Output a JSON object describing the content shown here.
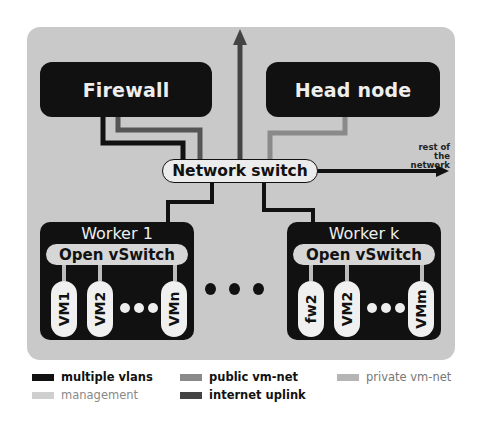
{
  "diagram": {
    "title": "",
    "nodes": {
      "firewall": "Firewall",
      "head_node": "Head node",
      "network_switch": "Network switch",
      "rest_of_network_line1": "rest of the",
      "rest_of_network_line2": "network"
    },
    "workers": [
      {
        "label": "Worker 1",
        "switch": "Open vSwitch",
        "vms": [
          "VM1",
          "VM2",
          "VMn"
        ]
      },
      {
        "label": "Worker k",
        "switch": "Open vSwitch",
        "vms": [
          "fw2",
          "VM2",
          "VMm"
        ]
      }
    ],
    "edges": [
      {
        "from": "Firewall",
        "to": "Network switch",
        "type": "multiple vlans"
      },
      {
        "from": "Firewall",
        "to": "Network switch",
        "type": "internet uplink"
      },
      {
        "from": "Network switch",
        "to": "internet (up)",
        "type": "internet uplink"
      },
      {
        "from": "Head node",
        "to": "Network switch",
        "type": "public vm-net"
      },
      {
        "from": "Network switch",
        "to": "rest of the network",
        "type": "multiple vlans"
      },
      {
        "from": "Network switch",
        "to": "Worker 1",
        "type": "multiple vlans"
      },
      {
        "from": "Network switch",
        "to": "Worker k",
        "type": "multiple vlans"
      }
    ]
  },
  "legend": [
    {
      "label": "multiple vlans",
      "color": "#111111",
      "text_color": "#111111"
    },
    {
      "label": "public vm-net",
      "color": "#8a8a8a",
      "text_color": "#111111"
    },
    {
      "label": "private vm-net",
      "color": "#b5b5b5",
      "text_color": "#777777"
    },
    {
      "label": "management",
      "color": "#cfcfcf",
      "text_color": "#888888"
    },
    {
      "label": "internet uplink",
      "color": "#444444",
      "text_color": "#111111"
    }
  ],
  "colors": {
    "panel": "#c9c9c9",
    "node": "#111111",
    "pill": "#ececec",
    "uplink": "#444444",
    "public": "#8a8a8a"
  }
}
